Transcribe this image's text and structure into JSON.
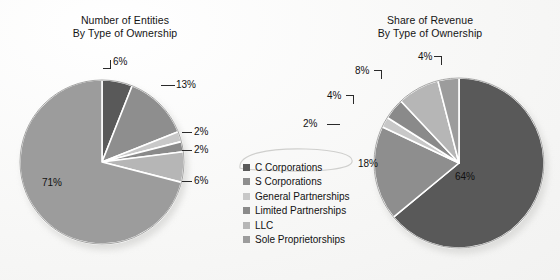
{
  "palette": {
    "background": "#fbfbfa",
    "separator": "#ffffff",
    "outline": "#9a9a98",
    "shadow": "#d9d9d7",
    "text": "#111111",
    "leader": "#2a2a2a",
    "series_colors": [
      "#595959",
      "#8e8e8e",
      "#c8c8c8",
      "#8a8a8a",
      "#b6b6b6",
      "#9c9c9c"
    ]
  },
  "legend": {
    "name": "type-of-ownership-legend",
    "items": [
      {
        "label": "C Corporations",
        "color": "#595959"
      },
      {
        "label": "S Corporations",
        "color": "#8e8e8e"
      },
      {
        "label": "General Partnerships",
        "color": "#c8c8c8"
      },
      {
        "label": "Limited Partnerships",
        "color": "#8a8a8a"
      },
      {
        "label": "LLC",
        "color": "#b6b6b6"
      },
      {
        "label": "Sole Proprietorships",
        "color": "#9c9c9c"
      }
    ]
  },
  "chart_data": [
    {
      "type": "pie",
      "id": "number-of-entities",
      "title": "Number of Entities",
      "subtitle": "By Type of Ownership",
      "xlabel": "",
      "ylabel": "",
      "unit": "percent",
      "legend_position": "center-between-charts",
      "grid": false,
      "start_angle_deg": 0,
      "direction": "clockwise",
      "categories": [
        "C Corporations",
        "S Corporations",
        "General Partnerships",
        "Limited Partnerships",
        "LLC",
        "Sole Proprietorships"
      ],
      "values": [
        6,
        13,
        2,
        2,
        6,
        71
      ],
      "labels": [
        "6%",
        "13%",
        "2%",
        "2%",
        "6%",
        "71%"
      ],
      "colors": [
        "#595959",
        "#8e8e8e",
        "#c8c8c8",
        "#8a8a8a",
        "#b6b6b6",
        "#9c9c9c"
      ],
      "label_placement": [
        "outside",
        "outside",
        "outside",
        "outside",
        "outside",
        "inside"
      ]
    },
    {
      "type": "pie",
      "id": "share-of-revenue",
      "title": "Share of Revenue",
      "subtitle": "By Type of Ownership",
      "xlabel": "",
      "ylabel": "",
      "unit": "percent",
      "legend_position": "center-between-charts",
      "grid": false,
      "start_angle_deg": 0,
      "direction": "clockwise",
      "categories": [
        "C Corporations",
        "S Corporations",
        "General Partnerships",
        "Limited Partnerships",
        "LLC",
        "Sole Proprietorships"
      ],
      "values": [
        64,
        18,
        2,
        4,
        8,
        4
      ],
      "labels": [
        "64%",
        "18%",
        "2%",
        "4%",
        "8%",
        "4%"
      ],
      "colors": [
        "#595959",
        "#8e8e8e",
        "#c8c8c8",
        "#8a8a8a",
        "#b6b6b6",
        "#9c9c9c"
      ],
      "label_placement": [
        "inside",
        "inside",
        "outside",
        "outside",
        "outside",
        "outside"
      ]
    }
  ],
  "left_chart": {
    "title_line1": "Number of Entities",
    "title_line2": "By Type of Ownership",
    "callouts": [
      {
        "text": "6%",
        "name": "left-label-c-corporations"
      },
      {
        "text": "13%",
        "name": "left-label-s-corporations"
      },
      {
        "text": "2%",
        "name": "left-label-general-partnerships"
      },
      {
        "text": "2%",
        "name": "left-label-limited-partnerships"
      },
      {
        "text": "6%",
        "name": "left-label-llc"
      },
      {
        "text": "71%",
        "name": "left-label-sole-proprietorships"
      }
    ]
  },
  "right_chart": {
    "title_line1": "Share of Revenue",
    "title_line2": "By Type of Ownership",
    "callouts": [
      {
        "text": "4%",
        "name": "right-label-sole-proprietorships"
      },
      {
        "text": "8%",
        "name": "right-label-llc"
      },
      {
        "text": "4%",
        "name": "right-label-limited-partnerships"
      },
      {
        "text": "2%",
        "name": "right-label-general-partnerships"
      },
      {
        "text": "18%",
        "name": "right-label-s-corporations"
      },
      {
        "text": "64%",
        "name": "right-label-c-corporations"
      }
    ]
  }
}
